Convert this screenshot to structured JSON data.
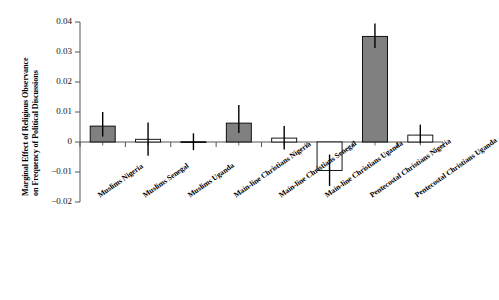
{
  "chart_data": {
    "type": "bar",
    "title": "",
    "subtitle": "",
    "xlabel": "",
    "ylabel": "Marginal Effect of Religious Observance on Frequency of Political Discussions",
    "ylabel_line1": "Marginal Effect of Religious Observance",
    "ylabel_line2": "on Frequency of Political Discussions",
    "ylim": [
      -0.02,
      0.04
    ],
    "yticks": [
      0.04,
      0.03,
      0.02,
      0.01,
      0,
      -0.01,
      -0.02
    ],
    "ytick_labels": [
      "0.04",
      "0.03",
      "0.02",
      "0.01",
      "0",
      "−0.01",
      "−0.02"
    ],
    "grid": false,
    "legend": "none",
    "categories": [
      "Muslims Nigeria",
      "Muslims Senegal",
      "Muslims Uganda",
      "Main-line Christians Nigeria",
      "Main-line Christians Senegal",
      "Main-line Christians Uganda",
      "Pentecostal Christians Nigeria",
      "Pentecostal Christians Uganda"
    ],
    "values": [
      0.0053,
      0.0009,
      0.0001,
      0.0063,
      0.0013,
      -0.0095,
      0.0352,
      0.0023
    ],
    "error_low": [
      0.0018,
      -0.0046,
      -0.0027,
      0.003,
      -0.0025,
      -0.0147,
      0.0313,
      -0.0004
    ],
    "error_high": [
      0.01,
      0.0065,
      0.0029,
      0.0123,
      0.0053,
      -0.0042,
      0.0395,
      0.0058
    ],
    "bar_fill": [
      "shaded",
      "white",
      "white",
      "shaded",
      "white",
      "white",
      "shaded",
      "white"
    ],
    "colors": {
      "shaded_bar": "#808080",
      "white_bar": "#ffffff",
      "bar_outline": "#000000",
      "axis": "#555555",
      "error_bar": "#000000",
      "text": "#000000"
    }
  }
}
